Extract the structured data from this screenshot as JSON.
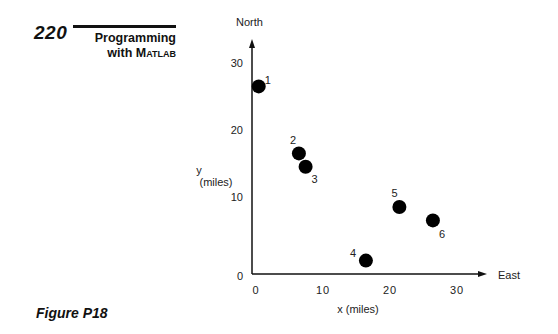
{
  "header": {
    "page_number": "220",
    "title_line1": "Programming",
    "title_line2_prefix": "with ",
    "title_line2_smallcaps": "Matlab"
  },
  "figure": {
    "label": "Figure P18"
  },
  "chart_data": {
    "type": "scatter",
    "title": "",
    "xlabel": "x (miles)",
    "ylabel": "y (miles)",
    "x_direction_label": "East",
    "y_direction_label": "North",
    "xlim": [
      0,
      35
    ],
    "ylim": [
      0,
      34
    ],
    "xticks": [
      0,
      10,
      20,
      30
    ],
    "yticks": [
      0,
      10,
      20,
      30
    ],
    "grid": false,
    "legend": null,
    "points": [
      {
        "label": "1",
        "x": 1,
        "y": 28
      },
      {
        "label": "2",
        "x": 7,
        "y": 18
      },
      {
        "label": "3",
        "x": 8,
        "y": 16
      },
      {
        "label": "4",
        "x": 17,
        "y": 2
      },
      {
        "label": "5",
        "x": 22,
        "y": 10
      },
      {
        "label": "6",
        "x": 27,
        "y": 8
      }
    ],
    "marker_color": "#000000"
  }
}
